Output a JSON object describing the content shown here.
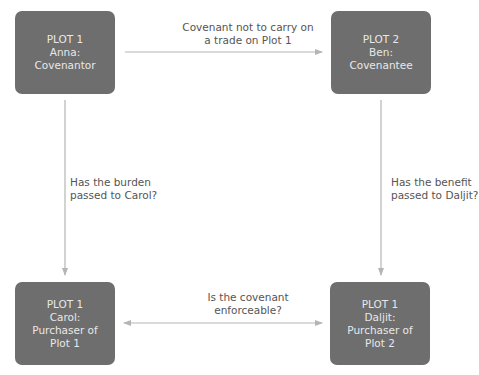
{
  "nodes": {
    "top_left": {
      "line1": "PLOT 1",
      "line2": "Anna:",
      "line3": "Covenantor"
    },
    "top_right": {
      "line1": "PLOT 2",
      "line2": "Ben:",
      "line3": "Covenantee"
    },
    "bottom_left": {
      "line1": "PLOT 1",
      "line2": "Carol:",
      "line3": "Purchaser of",
      "line4": "Plot 1"
    },
    "bottom_right": {
      "line1": "PLOT 1",
      "line2": "Daljit:",
      "line3": "Purchaser of",
      "line4": "Plot 2"
    }
  },
  "edges": {
    "top": {
      "line1": "Covenant not to carry on",
      "line2": "a trade on Plot 1"
    },
    "left": {
      "line1": "Has the burden",
      "line2": "passed to Carol?"
    },
    "right": {
      "line1": "Has the benefit",
      "line2": "passed to Daljit?"
    },
    "bottom": {
      "line1": "Is the covenant",
      "line2": "enforceable?"
    }
  },
  "colors": {
    "box": "#6e6e6e",
    "box_text": "#e8e8e8",
    "line": "#b5b5b5",
    "label": "#555555"
  }
}
